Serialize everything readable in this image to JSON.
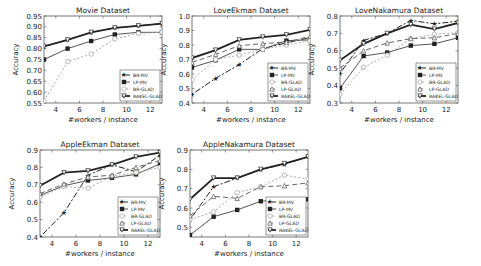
{
  "chart_data": [
    {
      "type": "line",
      "title": "Movie Dataset",
      "xlabel": "#workers / instance",
      "ylabel": "Accuracy",
      "xlim": [
        3,
        13
      ],
      "ylim": [
        0.55,
        0.95
      ],
      "xticks": [
        4,
        6,
        8,
        10,
        12
      ],
      "yticks": [
        0.55,
        0.6,
        0.65,
        0.7,
        0.75,
        0.8,
        0.85,
        0.9,
        0.95
      ],
      "ytick_labels": [
        "0.55",
        "0.60",
        "0.65",
        "0.70",
        "0.75",
        "0.80",
        "0.85",
        "0.90",
        "0.95"
      ],
      "x": [
        3,
        5,
        7,
        9,
        11,
        13
      ],
      "legend_position": "lower right",
      "series": [
        {
          "name": "BR-MV",
          "values": [
            0.81,
            0.84,
            0.875,
            0.895,
            0.905,
            0.915
          ]
        },
        {
          "name": "LP-MV",
          "values": [
            0.75,
            0.8,
            0.835,
            0.865,
            0.875,
            0.875
          ]
        },
        {
          "name": "BR-GLAD",
          "values": [
            0.56,
            0.74,
            0.775,
            0.845,
            0.87,
            0.875
          ]
        },
        {
          "name": "RAKEL-GLAD",
          "values": [
            0.81,
            0.84,
            0.875,
            0.895,
            0.905,
            0.915
          ]
        }
      ]
    },
    {
      "type": "line",
      "title": "LoveEkman Dataset",
      "xlabel": "#workers / instance",
      "ylabel": "Accuracy",
      "xlim": [
        3,
        13
      ],
      "ylim": [
        0.4,
        1.0
      ],
      "xticks": [
        4,
        6,
        8,
        10,
        12
      ],
      "yticks": [
        0.4,
        0.5,
        0.6,
        0.7,
        0.8,
        0.9,
        1.0
      ],
      "ytick_labels": [
        "0.4",
        "0.5",
        "0.6",
        "0.7",
        "0.8",
        "0.9",
        "1.0"
      ],
      "x": [
        3,
        5,
        7,
        9,
        11,
        13
      ],
      "legend_position": "lower right",
      "series": [
        {
          "name": "BR-MV",
          "values": [
            0.46,
            0.57,
            0.665,
            0.775,
            0.815,
            0.85
          ]
        },
        {
          "name": "LP-MV",
          "values": [
            0.645,
            0.695,
            0.77,
            0.77,
            0.83,
            0.835
          ]
        },
        {
          "name": "BR-GLAD",
          "values": [
            0.56,
            0.7,
            0.73,
            0.77,
            0.8,
            0.83
          ]
        },
        {
          "name": "LP-GLAD",
          "values": [
            0.68,
            0.735,
            0.795,
            0.81,
            0.82,
            0.86
          ]
        },
        {
          "name": "RAKEL-GLAD",
          "values": [
            0.71,
            0.765,
            0.835,
            0.855,
            0.87,
            0.905
          ]
        }
      ]
    },
    {
      "type": "line",
      "title": "LoveNakamura Dataset",
      "xlabel": "#workers / instance",
      "ylabel": "Accuracy",
      "xlim": [
        3,
        13
      ],
      "ylim": [
        0.3,
        0.8
      ],
      "xticks": [
        4,
        6,
        8,
        10,
        12
      ],
      "yticks": [
        0.3,
        0.4,
        0.5,
        0.6,
        0.7,
        0.8
      ],
      "ytick_labels": [
        "0.3",
        "0.4",
        "0.5",
        "0.6",
        "0.7",
        "0.8"
      ],
      "x": [
        3,
        5,
        7,
        9,
        11,
        13
      ],
      "legend_position": "lower right",
      "series": [
        {
          "name": "BR-MV",
          "values": [
            0.47,
            0.66,
            0.7,
            0.775,
            0.755,
            0.77
          ]
        },
        {
          "name": "LP-MV",
          "values": [
            0.385,
            0.57,
            0.59,
            0.63,
            0.64,
            0.675
          ]
        },
        {
          "name": "BR-GLAD",
          "values": [
            0.35,
            0.505,
            0.575,
            0.67,
            0.695,
            0.705
          ]
        },
        {
          "name": "LP-GLAD",
          "values": [
            0.5,
            0.6,
            0.645,
            0.67,
            0.675,
            0.7
          ]
        },
        {
          "name": "RAKEL-GLAD",
          "values": [
            0.545,
            0.64,
            0.7,
            0.75,
            0.725,
            0.76
          ]
        }
      ]
    },
    {
      "type": "line",
      "title": "AppleEkman Dataset",
      "xlabel": "#workers / instance",
      "ylabel": "Accuracy",
      "xlim": [
        3,
        13
      ],
      "ylim": [
        0.4,
        0.9
      ],
      "xticks": [
        4,
        6,
        8,
        10,
        12
      ],
      "yticks": [
        0.4,
        0.5,
        0.6,
        0.7,
        0.8,
        0.9
      ],
      "ytick_labels": [
        "0.4",
        "0.5",
        "0.6",
        "0.7",
        "0.8",
        "0.9"
      ],
      "x": [
        3,
        5,
        7,
        9,
        11,
        13
      ],
      "legend_position": "lower right",
      "series": [
        {
          "name": "BR-MV",
          "values": [
            0.4,
            0.54,
            0.755,
            0.815,
            0.775,
            0.87
          ]
        },
        {
          "name": "LP-MV",
          "values": [
            0.64,
            0.695,
            0.725,
            0.74,
            0.76,
            0.82
          ]
        },
        {
          "name": "BR-GLAD",
          "values": [
            0.63,
            0.69,
            0.68,
            0.75,
            0.77,
            0.8
          ]
        },
        {
          "name": "LP-GLAD",
          "values": [
            0.65,
            0.705,
            0.745,
            0.755,
            0.8,
            0.84
          ]
        },
        {
          "name": "RAKEL-GLAD",
          "values": [
            0.695,
            0.77,
            0.78,
            0.815,
            0.86,
            0.885
          ]
        }
      ]
    },
    {
      "type": "line",
      "title": "AppleNakamura Dataset",
      "xlabel": "#workers / instance",
      "ylabel": "Accuracy",
      "xlim": [
        3,
        13
      ],
      "ylim": [
        0.45,
        0.9
      ],
      "xticks": [
        4,
        6,
        8,
        10,
        12
      ],
      "yticks": [
        0.5,
        0.6,
        0.7,
        0.8,
        0.9
      ],
      "ytick_labels": [
        "0.5",
        "0.6",
        "0.7",
        "0.8",
        "0.9"
      ],
      "x": [
        3,
        5,
        7,
        9,
        11,
        13
      ],
      "legend_position": "lower right",
      "series": [
        {
          "name": "BR-MV",
          "values": [
            0.54,
            0.71,
            0.755,
            0.8,
            0.825,
            0.865
          ]
        },
        {
          "name": "LP-MV",
          "values": [
            0.46,
            0.555,
            0.59,
            0.635,
            0.645,
            0.645
          ]
        },
        {
          "name": "BR-GLAD",
          "values": [
            0.54,
            0.58,
            0.68,
            0.71,
            0.77,
            0.75
          ]
        },
        {
          "name": "LP-GLAD",
          "values": [
            0.56,
            0.66,
            0.65,
            0.71,
            0.715,
            0.73
          ]
        },
        {
          "name": "RAKEL-GLAD",
          "values": [
            0.645,
            0.755,
            0.755,
            0.8,
            0.83,
            0.865
          ]
        }
      ]
    }
  ],
  "series_styles": {
    "BR-MV": {
      "color": "#222222",
      "dash": "2,2,6,2",
      "marker": "star",
      "width": 1
    },
    "LP-MV": {
      "color": "#555555",
      "dash": "",
      "marker": "square",
      "width": 1
    },
    "BR-GLAD": {
      "color": "#aaaaaa",
      "dash": "2,2",
      "marker": "circle-open",
      "width": 1
    },
    "LP-GLAD": {
      "color": "#666666",
      "dash": "5,3",
      "marker": "triangle",
      "width": 1
    },
    "RAKEL-GLAD": {
      "color": "#222222",
      "dash": "",
      "marker": "triangle-down-open",
      "width": 1.8
    }
  },
  "layout": {
    "panels": [
      {
        "left": 44,
        "top": 16,
        "width": 118,
        "height": 87,
        "label_digits": 2
      },
      {
        "left": 192,
        "top": 16,
        "width": 118,
        "height": 87,
        "label_digits": 1
      },
      {
        "left": 340,
        "top": 16,
        "width": 118,
        "height": 87,
        "label_digits": 1
      },
      {
        "left": 40,
        "top": 150,
        "width": 120,
        "height": 87,
        "label_digits": 1
      },
      {
        "left": 190,
        "top": 150,
        "width": 118,
        "height": 87,
        "label_digits": 1
      }
    ]
  }
}
